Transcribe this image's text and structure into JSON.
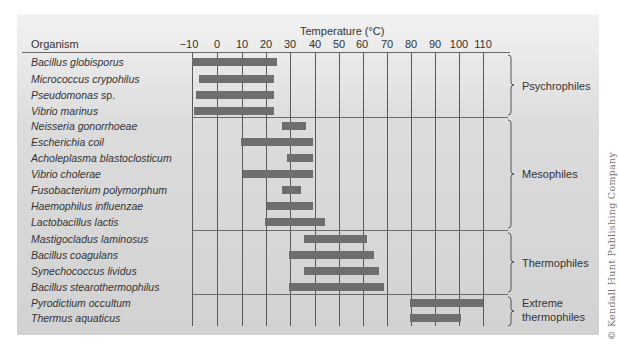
{
  "chart_data": {
    "type": "range-bar",
    "title": "Temperature (°C)",
    "xlabel": "Temperature (°C)",
    "ylabel": "Organism",
    "xlim": [
      -10,
      110
    ],
    "x_ticks": [
      -10,
      0,
      10,
      20,
      30,
      40,
      50,
      60,
      70,
      80,
      90,
      100,
      110
    ],
    "grid": "vertical",
    "groups": [
      {
        "name": "Psychrophiles",
        "organisms": [
          {
            "name": "Bacillus globisporus",
            "min": -10,
            "max": 25
          },
          {
            "name": "Micrococcus crypohilus",
            "min": -7,
            "max": 24
          },
          {
            "name": "Pseudomonas sp.",
            "min": -8,
            "max": 24
          },
          {
            "name": "Vibrio marinus",
            "min": -9,
            "max": 24
          }
        ]
      },
      {
        "name": "Mesophiles",
        "organisms": [
          {
            "name": "Neisseria gonorrhoeae",
            "min": 27,
            "max": 37
          },
          {
            "name": "Escherichia coil",
            "min": 10,
            "max": 40
          },
          {
            "name": "Acholeplasma blastoclosticum",
            "min": 29,
            "max": 40
          },
          {
            "name": "Vibrio cholerae",
            "min": 11,
            "max": 40
          },
          {
            "name": "Fusobacterium polymorphum",
            "min": 27,
            "max": 35
          },
          {
            "name": "Haemophilus influenzae",
            "min": 21,
            "max": 40
          },
          {
            "name": "Lactobacillus lactis",
            "min": 20,
            "max": 45
          }
        ]
      },
      {
        "name": "Thermophiles",
        "organisms": [
          {
            "name": "Mastigocladus laminosus",
            "min": 36,
            "max": 62
          },
          {
            "name": "Bacillus coagulans",
            "min": 30,
            "max": 65
          },
          {
            "name": "Synechococcus lividus",
            "min": 36,
            "max": 67
          },
          {
            "name": "Bacillus stearothermophilus",
            "min": 30,
            "max": 69
          }
        ]
      },
      {
        "name": "Extreme thermophiles",
        "organisms": [
          {
            "name": "Pyrodictium occultum",
            "min": 80,
            "max": 110
          },
          {
            "name": "Thermus aquaticus",
            "min": 80,
            "max": 101
          }
        ]
      }
    ]
  },
  "header": {
    "organism_label": "Organism",
    "temperature_label": "Temperature (°C)",
    "ticks": [
      "−10",
      "0",
      "10",
      "20",
      "30",
      "40",
      "50",
      "60",
      "70",
      "80",
      "90",
      "100",
      "110"
    ]
  },
  "group_labels": {
    "psychrophiles": "Psychrophiles",
    "mesophiles": "Mesophiles",
    "thermophiles": "Thermophiles",
    "extreme_line1": "Extreme",
    "extreme_line2": "thermophiles"
  },
  "rows": [
    "Bacillus globisporus",
    "Micrococcus crypohilus",
    "Pseudomonas",
    "Vibrio marinus",
    "Neisseria gonorrhoeae",
    "Escherichia coil",
    "Acholeplasma blastoclosticum",
    "Vibrio cholerae",
    "Fusobacterium polymorphum",
    "Haemophilus influenzae",
    "Lactobacillus lactis",
    "Mastigocladus laminosus",
    "Bacillus coagulans",
    "Synechococcus lividus",
    "Bacillus stearothermophilus",
    "Pyrodictium occultum",
    "Thermus aquaticus"
  ],
  "pseudomonas_suffix": " sp.",
  "colors": {
    "bar": "#6e6e6e",
    "grid": "#5a5a5a",
    "background": "#d6d6d6"
  },
  "copyright": "© Kendall Hunt Publishing Company"
}
